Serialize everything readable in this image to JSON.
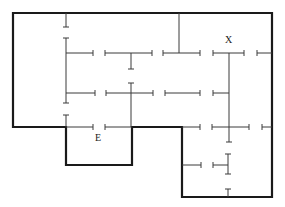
{
  "diagram": {
    "type": "floor-plan-maze",
    "colors": {
      "wall": "#1a1a1a",
      "partition": "#3a3a3a",
      "background": "#ffffff"
    },
    "labels": [
      {
        "id": "x",
        "text": "X",
        "x": 225,
        "y": 35
      },
      {
        "id": "e",
        "text": "E",
        "x": 95,
        "y": 133
      }
    ],
    "outer_wall_path": "M13,13 L272,13 L272,197 L182,197 L182,127 L132,127 L132,165 L66,165 L66,127 L13,127 Z",
    "partitions": [
      {
        "x1": 66,
        "y1": 13,
        "x2": 66,
        "y2": 27,
        "end_tick": true
      },
      {
        "x1": 66,
        "y1": 38,
        "x2": 66,
        "y2": 103,
        "start_tick": true,
        "end_tick": true
      },
      {
        "x1": 66,
        "y1": 115,
        "x2": 66,
        "y2": 127,
        "start_tick": true
      },
      {
        "x1": 179,
        "y1": 13,
        "x2": 179,
        "y2": 53
      },
      {
        "x1": 66,
        "y1": 53,
        "x2": 93,
        "y2": 53,
        "end_tick": true
      },
      {
        "x1": 105,
        "y1": 53,
        "x2": 152,
        "y2": 53,
        "start_tick": true,
        "end_tick": true
      },
      {
        "x1": 131,
        "y1": 53,
        "x2": 131,
        "y2": 69,
        "end_tick": true
      },
      {
        "x1": 163,
        "y1": 53,
        "x2": 200,
        "y2": 53,
        "start_tick": true,
        "end_tick": true
      },
      {
        "x1": 213,
        "y1": 53,
        "x2": 244,
        "y2": 53,
        "start_tick": true,
        "end_tick": true
      },
      {
        "x1": 257,
        "y1": 53,
        "x2": 272,
        "y2": 53,
        "start_tick": true
      },
      {
        "x1": 229,
        "y1": 53,
        "x2": 229,
        "y2": 142,
        "end_tick": true
      },
      {
        "x1": 66,
        "y1": 93,
        "x2": 95,
        "y2": 93,
        "end_tick": true
      },
      {
        "x1": 106,
        "y1": 93,
        "x2": 153,
        "y2": 93,
        "start_tick": true,
        "end_tick": true
      },
      {
        "x1": 131,
        "y1": 83,
        "x2": 131,
        "y2": 127,
        "start_tick": true
      },
      {
        "x1": 165,
        "y1": 93,
        "x2": 200,
        "y2": 93,
        "start_tick": true,
        "end_tick": true
      },
      {
        "x1": 213,
        "y1": 93,
        "x2": 229,
        "y2": 93,
        "start_tick": true
      },
      {
        "x1": 66,
        "y1": 127,
        "x2": 93,
        "y2": 127,
        "end_tick": true
      },
      {
        "x1": 105,
        "y1": 127,
        "x2": 132,
        "y2": 127,
        "start_tick": true
      },
      {
        "x1": 182,
        "y1": 127,
        "x2": 200,
        "y2": 127,
        "end_tick": true
      },
      {
        "x1": 212,
        "y1": 127,
        "x2": 249,
        "y2": 127,
        "start_tick": true,
        "end_tick": true
      },
      {
        "x1": 262,
        "y1": 127,
        "x2": 272,
        "y2": 127,
        "start_tick": true
      },
      {
        "x1": 182,
        "y1": 165,
        "x2": 201,
        "y2": 165,
        "end_tick": true
      },
      {
        "x1": 213,
        "y1": 165,
        "x2": 228,
        "y2": 165,
        "start_tick": true
      },
      {
        "x1": 228,
        "y1": 154,
        "x2": 228,
        "y2": 174,
        "start_tick": true,
        "end_tick": true
      },
      {
        "x1": 228,
        "y1": 189,
        "x2": 228,
        "y2": 197,
        "start_tick": true
      }
    ]
  }
}
